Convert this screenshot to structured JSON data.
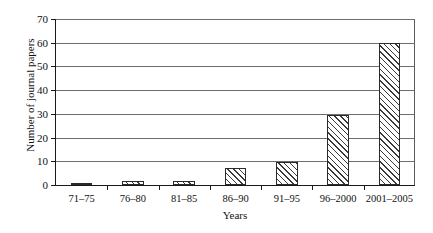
{
  "chart_data": {
    "type": "bar",
    "title": "",
    "categories": [
      "71–75",
      "76–80",
      "81–85",
      "86–90",
      "91–95",
      "96–2000",
      "2001–2005"
    ],
    "values": [
      0.5,
      1.5,
      1.5,
      7,
      9.5,
      29.5,
      60
    ],
    "xlabel": "Years",
    "ylabel": "Number of journal papers",
    "ylim": [
      0,
      70
    ],
    "ytick_labels": [
      "0",
      "10",
      "20",
      "30",
      "40",
      "50",
      "60",
      "70"
    ],
    "ytick_values": [
      0,
      10,
      20,
      30,
      40,
      50,
      60,
      70
    ],
    "grid": "horizontal",
    "legend": "none",
    "bar_fill": "diagonal-hatch",
    "bar_edge_color": "#2a2a2a",
    "axis_color": "#1a1a1a",
    "grid_color": "#6e6e6e",
    "background": "#ffffff"
  }
}
